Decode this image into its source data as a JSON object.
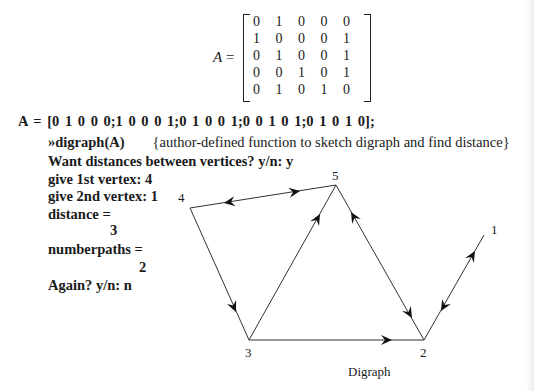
{
  "matrix": {
    "label": "A",
    "equals": " =",
    "rows": [
      [
        "0",
        "1",
        "0",
        "0",
        "0"
      ],
      [
        "1",
        "0",
        "0",
        "0",
        "1"
      ],
      [
        "0",
        "1",
        "0",
        "0",
        "1"
      ],
      [
        "0",
        "0",
        "1",
        "0",
        "1"
      ],
      [
        "0",
        "1",
        "0",
        "1",
        "0"
      ]
    ]
  },
  "session": {
    "assignment": "A = [0   1   0   0   0;1   0   0   0   1;0   1   0   0   1;0   0   1   0   1;0   1   0   1   0];",
    "command": "»digraph(A)",
    "comment": "{author-defined function to sketch digraph and find distance}",
    "prompt_distances": "Want distances between vertices? y/n: y",
    "prompt_first": "give 1st vertex: 4",
    "prompt_second": "give 2nd vertex: 1",
    "distance_label": "distance =",
    "distance_value": "3",
    "numberpaths_label": "numberpaths =",
    "numberpaths_value": "2",
    "prompt_again": "Again? y/n: n"
  },
  "graph": {
    "caption": "Digraph",
    "vertices": [
      {
        "id": "1",
        "x": 484,
        "y": 235
      },
      {
        "id": "2",
        "x": 424,
        "y": 340
      },
      {
        "id": "3",
        "x": 249,
        "y": 340
      },
      {
        "id": "4",
        "x": 190,
        "y": 208
      },
      {
        "id": "5",
        "x": 336,
        "y": 185
      }
    ],
    "edges": [
      {
        "from": "1",
        "to": "2"
      },
      {
        "from": "2",
        "to": "1"
      },
      {
        "from": "2",
        "to": "5"
      },
      {
        "from": "3",
        "to": "2"
      },
      {
        "from": "3",
        "to": "5"
      },
      {
        "from": "4",
        "to": "3"
      },
      {
        "from": "4",
        "to": "5"
      },
      {
        "from": "5",
        "to": "2"
      },
      {
        "from": "5",
        "to": "4"
      }
    ],
    "colors": {
      "line": "#333333",
      "arrow": "#111111"
    }
  }
}
